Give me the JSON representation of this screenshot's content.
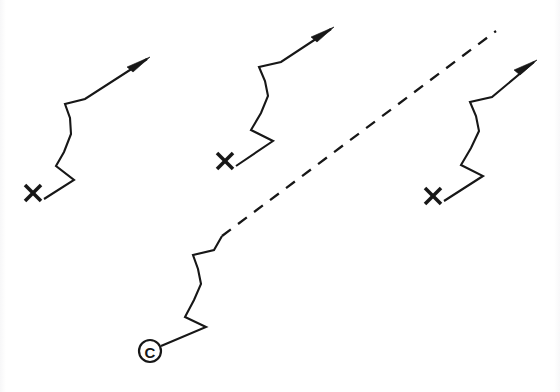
{
  "figure": {
    "background_color": "#ffffff",
    "ink_color": "#171717",
    "width": 560,
    "height": 392
  },
  "markers": {
    "start_cross_label": "X",
    "start_circle_label": "C",
    "circle_radius": 11
  },
  "paths": [
    {
      "id": "path-left",
      "name": "left-zigzag-track",
      "start_marker": "X",
      "start_marker_position": {
        "x": 33,
        "y": 193
      },
      "end_marker": "arrow",
      "line_style": "solid",
      "points": "44,199 74,180 56,166 64,152 71,134 70,118 65,104 85,99 147,59",
      "arrow_tip": {
        "x": 150,
        "y": 57
      },
      "arrow_polygon": "150,57 127,67 133,72"
    },
    {
      "id": "path-middle",
      "name": "middle-zigzag-track",
      "start_marker": "X",
      "start_marker_position": {
        "x": 225,
        "y": 161
      },
      "end_marker": "arrow",
      "line_style": "solid",
      "points": "236,166 273,141 251,130 261,113 268,96 265,81 259,67 281,62 331,29",
      "arrow_tip": {
        "x": 334,
        "y": 27
      },
      "arrow_polygon": "334,27 311,37 317,42"
    },
    {
      "id": "path-right",
      "name": "right-zigzag-track",
      "start_marker": "X",
      "start_marker_position": {
        "x": 433,
        "y": 196
      },
      "end_marker": "arrow",
      "line_style": "solid",
      "points": "444,201 483,176 461,165 471,148 479,131 476,116 470,102 492,97 534,62",
      "arrow_tip": {
        "x": 537,
        "y": 60
      },
      "arrow_polygon": "537,60 514,70 520,75"
    },
    {
      "id": "path-bottom",
      "name": "bottom-zigzag-dashed-track",
      "start_marker": "C",
      "start_marker_position": {
        "x": 150,
        "y": 351
      },
      "end_marker": "none",
      "line_style": "solid-then-dashed",
      "points": "161,346 206,327 185,317 194,300 201,284 198,269 193,255 214,250 222,236",
      "dashed_from": {
        "x": 222,
        "y": 236
      },
      "dashed_to": {
        "x": 496,
        "y": 31
      }
    }
  ]
}
